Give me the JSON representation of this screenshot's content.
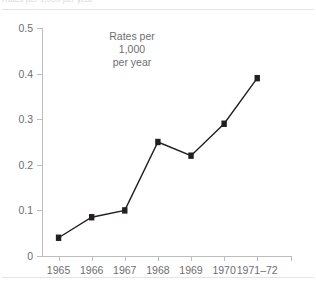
{
  "caption": {
    "top_fragment": "Rates per 1,000 per year"
  },
  "annotation": {
    "line1": "Rates per",
    "line2": "1,000",
    "line3": "per year"
  },
  "axes": {
    "y_ticks": [
      "0.5",
      "0.4",
      "0.3",
      "0.2",
      "0.1",
      "0"
    ],
    "x_ticks": [
      "1965",
      "1966",
      "1967",
      "1968",
      "1969",
      "1970",
      "1971–72"
    ]
  },
  "colors": {
    "line": "#231f20",
    "marker": "#231f20",
    "axis": "#bcbdbf",
    "text": "#6d6e71",
    "rule": "#e3e4e5"
  },
  "chart_data": {
    "type": "line",
    "title": "",
    "xlabel": "",
    "ylabel": "Rates per 1,000 per year",
    "categories": [
      "1965",
      "1966",
      "1967",
      "1968",
      "1969",
      "1970",
      "1971–72"
    ],
    "values": [
      0.04,
      0.085,
      0.1,
      0.25,
      0.22,
      0.29,
      0.39
    ],
    "ylim": [
      0,
      0.5
    ],
    "ytick_values": [
      0,
      0.1,
      0.2,
      0.3,
      0.4,
      0.5
    ],
    "grid": false,
    "legend": null,
    "markers": "square",
    "annotations": [
      "Rates per",
      "1,000",
      "per year"
    ]
  }
}
